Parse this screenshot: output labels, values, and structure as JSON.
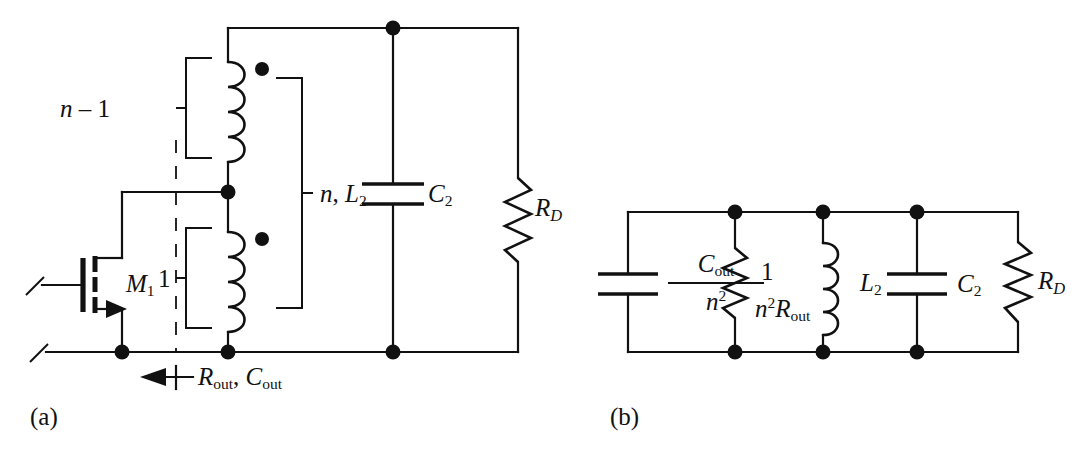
{
  "figure": {
    "panels": [
      {
        "id": "a",
        "caption": "(a)"
      },
      {
        "id": "b",
        "caption": "(b)"
      }
    ],
    "stroke_color": "#111111",
    "background_color": "#ffffff"
  },
  "panel_a": {
    "caption": "(a)",
    "transistor": {
      "name": "M1",
      "label_main": "M",
      "label_sub": "1",
      "type": "nmos"
    },
    "turns_primary_label": {
      "text": "1",
      "meaning": "primary-turns"
    },
    "turns_secondary_label": {
      "main": "n",
      "minus": " – ",
      "value": "1",
      "meaning": "secondary-extra-turns"
    },
    "transformer_label": {
      "turns": "n",
      "separator": ", ",
      "inductance_main": "L",
      "inductance_sub": "2"
    },
    "capacitor": {
      "main": "C",
      "sub": "2"
    },
    "resistor": {
      "main": "R",
      "sub": "D"
    },
    "output_impedance": {
      "r_main": "R",
      "r_sub": "out",
      "separator": ", ",
      "c_main": "C",
      "c_sub": "out",
      "full_text": "Rout, Cout",
      "arrow_direction": "left"
    },
    "dots": [
      {
        "name": "polarity-dot-upper",
        "x": 262,
        "y": 69
      },
      {
        "name": "polarity-dot-lower",
        "x": 262,
        "y": 239
      }
    ],
    "junction_nodes": [
      {
        "name": "node-top-rail-c2",
        "x": 393,
        "y": 28
      },
      {
        "name": "node-center-tap",
        "x": 228,
        "y": 192
      },
      {
        "name": "node-source-ground",
        "x": 122,
        "y": 352
      },
      {
        "name": "node-winding-ground",
        "x": 228,
        "y": 352
      },
      {
        "name": "node-bottom-rail-c2",
        "x": 393,
        "y": 352
      }
    ]
  },
  "panel_b": {
    "caption": "(b)",
    "cap_out_over_n2": {
      "numerator_main": "C",
      "numerator_sub": "out",
      "denominator_main": "n",
      "denominator_sup": "2"
    },
    "resistor_reflected": {
      "numerator": "1",
      "denominator_main1": "n",
      "denominator_sup": "2",
      "denominator_main2": "R",
      "denominator_sub": "out",
      "has_visible_bar": false
    },
    "inductor": {
      "main": "L",
      "sub": "2"
    },
    "capacitor": {
      "main": "C",
      "sub": "2"
    },
    "resistor": {
      "main": "R",
      "sub": "D"
    },
    "junction_nodes": [
      {
        "name": "node-top-r",
        "x": 735,
        "y": 212
      },
      {
        "name": "node-top-l2",
        "x": 823,
        "y": 212
      },
      {
        "name": "node-top-c2",
        "x": 917,
        "y": 212
      },
      {
        "name": "node-bot-r",
        "x": 735,
        "y": 352
      },
      {
        "name": "node-bot-l2",
        "x": 823,
        "y": 352
      },
      {
        "name": "node-bot-c2",
        "x": 917,
        "y": 352
      }
    ]
  }
}
